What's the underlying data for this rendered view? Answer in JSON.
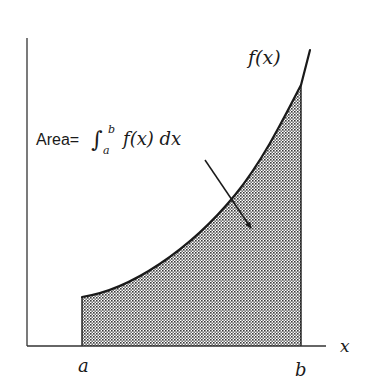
{
  "diagram": {
    "type": "definite-integral-area",
    "curve_label": "f(x)",
    "x_axis_label": "x",
    "lower_bound_label": "a",
    "upper_bound_label": "b",
    "area_annotation": {
      "prefix": "Area=",
      "integral_symbol": "∫",
      "upper_limit": "b",
      "lower_limit": "a",
      "integrand": "f(x) dx"
    },
    "colors": {
      "ink": "#1a1a1a",
      "shade_dot": "#3a3a3a",
      "background": "#ffffff"
    }
  }
}
